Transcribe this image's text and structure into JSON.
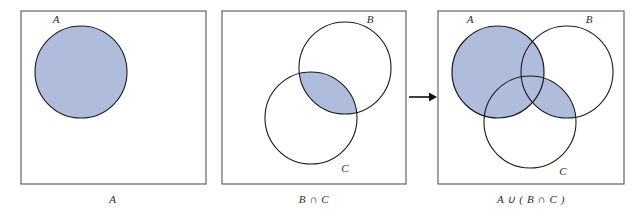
{
  "figure": {
    "type": "venn-diagram-sequence",
    "shade_color": "#b0bcdc",
    "stroke_color": "#1a1a1a",
    "box_stroke_color": "#555555",
    "background": "#ffffff"
  },
  "panels": [
    {
      "id": "panel-a",
      "caption": "A",
      "box": {
        "x": 21,
        "y": 11,
        "w": 185,
        "h": 173
      },
      "circles": [
        {
          "name": "A",
          "label": "A",
          "cx": 81,
          "cy": 72,
          "r": 46,
          "label_x": 56,
          "label_y": 23,
          "shaded": true
        }
      ],
      "shaded_region": "A"
    },
    {
      "id": "panel-b-cap-c",
      "caption": "B ∩ C",
      "box": {
        "x": 222,
        "y": 11,
        "w": 184,
        "h": 173
      },
      "circles": [
        {
          "name": "B",
          "label": "B",
          "cx": 345,
          "cy": 68,
          "r": 46,
          "label_x": 370,
          "label_y": 23,
          "shaded": false
        },
        {
          "name": "C",
          "label": "C",
          "cx": 311,
          "cy": 118,
          "r": 46,
          "label_x": 345,
          "label_y": 172,
          "shaded": false
        }
      ],
      "shaded_region": "B ∩ C"
    },
    {
      "id": "panel-a-cup-b-cap-c",
      "caption": "A ∪ ( B ∩ C )",
      "box": {
        "x": 438,
        "y": 11,
        "w": 186,
        "h": 173
      },
      "circles": [
        {
          "name": "A",
          "label": "A",
          "cx": 498,
          "cy": 72,
          "r": 46,
          "label_x": 470,
          "label_y": 23,
          "shaded": true
        },
        {
          "name": "B",
          "label": "B",
          "cx": 567,
          "cy": 72,
          "r": 46,
          "label_x": 589,
          "label_y": 23,
          "shaded": false
        },
        {
          "name": "C",
          "label": "C",
          "cx": 530,
          "cy": 122,
          "r": 46,
          "label_x": 563,
          "label_y": 175,
          "shaded": false
        }
      ],
      "shaded_region": "A ∪ ( B ∩ C )"
    }
  ],
  "arrow": {
    "name": "rightwards-arrow",
    "glyph": "→",
    "x1": 409,
    "x2": 435,
    "y": 97
  },
  "captions": {
    "panel1": "A",
    "panel2": "B ∩ C",
    "panel3": "A ∪ ( B ∩ C )",
    "panel1_x": 113,
    "panel2_x": 314,
    "panel3_x": 531,
    "y": 202
  }
}
